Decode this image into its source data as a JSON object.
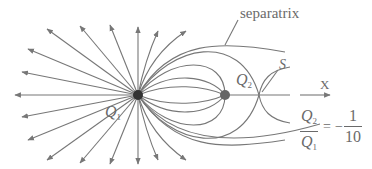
{
  "figure": {
    "labels": {
      "separatrix": "separatrix",
      "q1": "Q",
      "q1_sub": "1",
      "q2": "Q",
      "q2_sub": "2",
      "saddle": "S",
      "axis": "X"
    },
    "ratio": {
      "num": "Q",
      "num_sub": "2",
      "den": "Q",
      "den_sub": "1",
      "equals": "=",
      "sign": "−",
      "value_num": "1",
      "value_den": "10"
    },
    "colors": {
      "line": "#777777",
      "q1_charge": "#333333",
      "q2_charge": "#666666",
      "text": "#6a6a6a"
    },
    "charges": {
      "q1": {
        "x": 138,
        "y": 95
      },
      "q2": {
        "x": 225,
        "y": 95
      },
      "saddle": {
        "x": 259,
        "y": 95
      }
    }
  }
}
